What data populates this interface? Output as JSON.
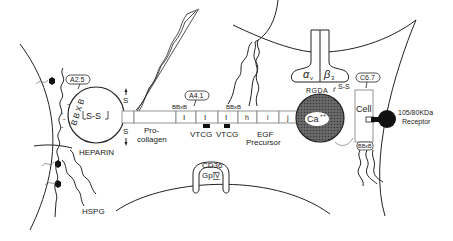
{
  "diagram": {
    "heparin_domain": {
      "balloon": "A2.5",
      "motif": "BBXB",
      "disulfide": "S-S",
      "label": "HEPARIN",
      "proteoglycan_label": "HSPG",
      "charges": [
        "-",
        "-",
        "-",
        "-"
      ]
    },
    "interchain_disulfides": {
      "top": "S",
      "bottom": "S"
    },
    "procollagen_label_line1": "Pro-",
    "procollagen_label_line2": "collagen",
    "type1_repeats": {
      "balloon": "A4.1",
      "motif_left": "BBxB",
      "motif_right": "BBxB",
      "repeat_labels": [
        "I",
        "I",
        "I"
      ],
      "vtcg_labels": [
        "VTCG",
        "VTCG"
      ]
    },
    "egf_repeats": {
      "segments": [
        "h",
        "i",
        "j"
      ],
      "label_line1": "EGF",
      "label_line2": "Precursor"
    },
    "cd36": {
      "line1": "CD36",
      "line2": "Gp",
      "line2_numeral": "IV"
    },
    "integrin": {
      "alpha": "α",
      "alpha_sub": "v",
      "beta": "β",
      "beta_sub": "3"
    },
    "calcium_domain": {
      "label": "Ca",
      "superscript": "++",
      "motif": "RGDA",
      "disulfide": "S-S"
    },
    "cell_domain": {
      "balloon": "C6.7",
      "label": "Cell",
      "motif": "BBxB"
    },
    "receptor": {
      "line1": "105/80KDa",
      "line2": "Receptor"
    },
    "colors": {
      "ink": "#222222",
      "ca_fill": "#555555",
      "receptor_fill": "#111111"
    }
  }
}
